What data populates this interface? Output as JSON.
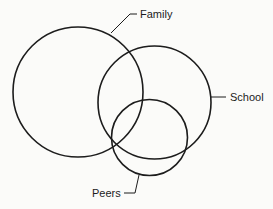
{
  "diagram": {
    "type": "venn",
    "stroke_color": "#1c1c1c",
    "background_color": "#fbfbf9",
    "sets": [
      {
        "id": "family",
        "label": "Family",
        "cx": 78,
        "cy": 92,
        "r": 65
      },
      {
        "id": "school",
        "label": "School",
        "cx": 154.5,
        "cy": 102.5,
        "r": 56.5
      },
      {
        "id": "peers",
        "label": "Peers",
        "cx": 149.5,
        "cy": 137.5,
        "r": 38
      }
    ]
  },
  "labels": {
    "family": "Family",
    "school": "School",
    "peers": "Peers"
  }
}
